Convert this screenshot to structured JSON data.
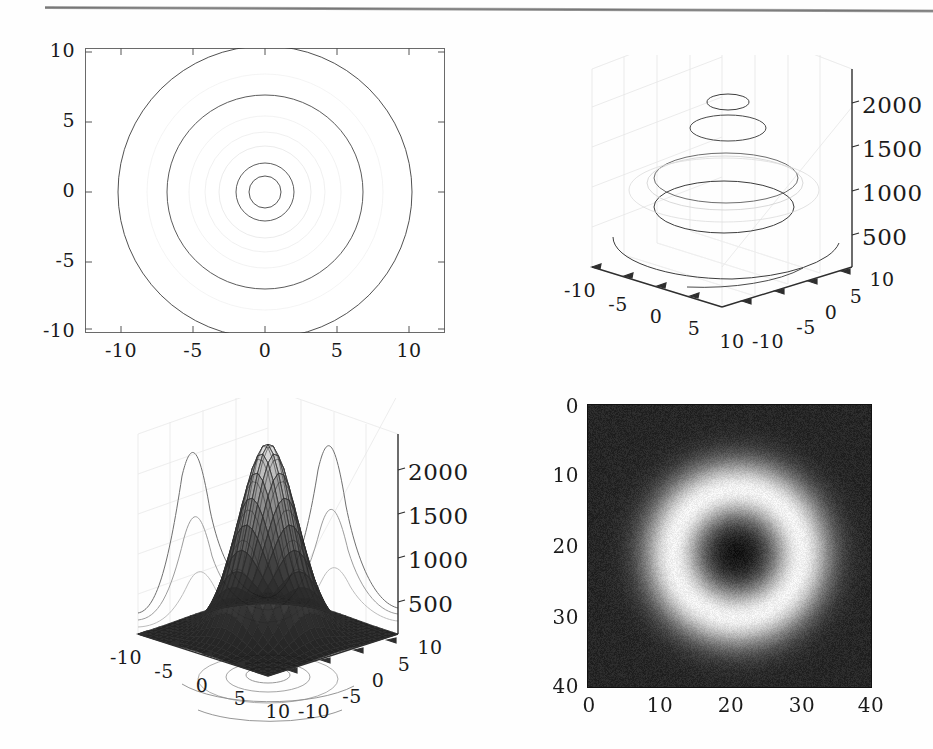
{
  "figure": {
    "panel_count": 4,
    "background": "#ffffff",
    "rule_color": "#6e6e6e"
  },
  "panels": {
    "contour2d": {
      "name": "2D contour plot",
      "xticks": [
        "-10",
        "-5",
        "0",
        "5",
        "10"
      ],
      "yticks": [
        "10",
        "5",
        "0",
        "-5",
        "-10"
      ]
    },
    "contour3d": {
      "name": "3D contour plot",
      "xticks": [
        "-10",
        "-5",
        "0",
        "5",
        "10"
      ],
      "yticks": [
        "-10",
        "-5",
        "0",
        "5",
        "10"
      ],
      "zticks": [
        "500",
        "1000",
        "1500",
        "2000"
      ]
    },
    "surface3d": {
      "name": "3D surface plot with projected profiles",
      "xticks": [
        "-10",
        "-5",
        "0",
        "5",
        "10"
      ],
      "yticks": [
        "-10",
        "-5",
        "0",
        "5",
        "10"
      ],
      "zticks": [
        "500",
        "1000",
        "1500",
        "2000"
      ]
    },
    "image": {
      "name": "grayscale image plot",
      "xticks": [
        "0",
        "10",
        "20",
        "30",
        "40"
      ],
      "yticks": [
        "0",
        "10",
        "20",
        "30",
        "40"
      ]
    }
  },
  "chart_data": [
    {
      "type": "line",
      "id": "contour2d",
      "title": "",
      "xlabel": "",
      "ylabel": "",
      "xlim": [
        -12.5,
        12.5
      ],
      "ylim": [
        -10,
        10
      ],
      "xticks": [
        -10,
        -5,
        0,
        5,
        10
      ],
      "yticks": [
        -10,
        -5,
        0,
        5,
        10
      ],
      "grid": false,
      "legend": "none",
      "description": "Concentric circular contour rings of a radially symmetric ring function centred at (0,0)",
      "contour_radii": [
        1.1,
        2.0,
        6.8,
        10.2
      ],
      "contour_levels": [
        2000,
        1500,
        1000,
        500
      ]
    },
    {
      "type": "line",
      "id": "contour3d",
      "title": "",
      "xlabel": "",
      "ylabel": "",
      "zlabel": "",
      "xlim": [
        -10,
        10
      ],
      "ylim": [
        -10,
        10
      ],
      "zlim": [
        0,
        2200
      ],
      "xticks": [
        -10,
        -5,
        0,
        5,
        10
      ],
      "yticks": [
        -10,
        -5,
        0,
        5,
        10
      ],
      "zticks": [
        500,
        1000,
        1500,
        2000
      ],
      "grid": true,
      "legend": "none",
      "description": "Stacked contour rings drawn at their z level; small ring high, large rings low",
      "rings": [
        {
          "z": 2000,
          "radius": 1.1
        },
        {
          "z": 1500,
          "radius": 2.0
        },
        {
          "z": 1000,
          "radius": 4.2
        },
        {
          "z": 700,
          "radius": 6.8
        },
        {
          "z": 400,
          "radius": 10.2
        }
      ]
    },
    {
      "type": "area",
      "id": "surface3d",
      "title": "",
      "xlabel": "",
      "ylabel": "",
      "zlabel": "",
      "xlim": [
        -10,
        10
      ],
      "ylim": [
        -10,
        10
      ],
      "zlim": [
        0,
        2200
      ],
      "xticks": [
        -10,
        -5,
        0,
        5,
        10
      ],
      "yticks": [
        -10,
        -5,
        0,
        5,
        10
      ],
      "zticks": [
        500,
        1000,
        1500,
        2000
      ],
      "grid": true,
      "legend": "none",
      "description": "Wireframe Gaussian surface peaking near 2100 at (0,0), with profile curves projected on the two back walls and filled contours projected on the floor",
      "peak_value": 2100,
      "peak_xy": [
        0,
        0
      ],
      "sigma": 3.2
    },
    {
      "type": "heatmap",
      "id": "image",
      "title": "",
      "xlabel": "",
      "ylabel": "",
      "xlim": [
        0,
        40
      ],
      "ylim": [
        40,
        0
      ],
      "xticks": [
        0,
        10,
        20,
        30,
        40
      ],
      "yticks": [
        0,
        10,
        20,
        30,
        40
      ],
      "grid": false,
      "legend": "none",
      "colormap": "gray",
      "description": "Noisy grayscale image: dark circular core at (21,21), surrounded by a bright annulus, on a dark background",
      "center": [
        21,
        21
      ],
      "core_radius": 5.5,
      "ring_peak_radius": 9.0,
      "ring_outer_radius": 15.0
    }
  ]
}
